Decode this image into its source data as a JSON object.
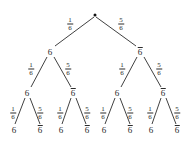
{
  "diagram": {
    "type": "probability-tree",
    "levels": 3,
    "background_color": "#ffffff",
    "line_color": "#2b2b2b",
    "text_color": "#2b2b2b",
    "branch_labels": {
      "left": "1/6",
      "right": "5/6"
    },
    "fraction": {
      "numerator_left": "1",
      "denominator_left": "6",
      "numerator_right": "5",
      "denominator_right": "6"
    },
    "node_labels": {
      "success": "6",
      "failure": "6"
    },
    "root": {
      "name": "root-node",
      "x": 95,
      "y": 15,
      "label": ""
    },
    "level1": [
      {
        "name": "node-6",
        "x": 50,
        "y": 52,
        "label": "6",
        "overbar": false
      },
      {
        "name": "node-not6",
        "x": 140,
        "y": 52,
        "label": "6",
        "overbar": true
      }
    ],
    "level2": [
      {
        "name": "node-6",
        "x": 27,
        "y": 93,
        "label": "6",
        "overbar": false
      },
      {
        "name": "node-not6",
        "x": 73,
        "y": 93,
        "label": "6",
        "overbar": true
      },
      {
        "name": "node-6",
        "x": 117,
        "y": 93,
        "label": "6",
        "overbar": false
      },
      {
        "name": "node-not6",
        "x": 163,
        "y": 93,
        "label": "6",
        "overbar": true
      }
    ],
    "level3": [
      {
        "name": "leaf-6",
        "x": 14,
        "y": 130,
        "label": "6",
        "overbar": false
      },
      {
        "name": "leaf-not6",
        "x": 40,
        "y": 130,
        "label": "6",
        "overbar": true
      },
      {
        "name": "leaf-6",
        "x": 61,
        "y": 130,
        "label": "6",
        "overbar": false
      },
      {
        "name": "leaf-not6",
        "x": 87,
        "y": 130,
        "label": "6",
        "overbar": true
      },
      {
        "name": "leaf-6",
        "x": 104,
        "y": 130,
        "label": "6",
        "overbar": false
      },
      {
        "name": "leaf-not6",
        "x": 130,
        "y": 130,
        "label": "6",
        "overbar": true
      },
      {
        "name": "leaf-6",
        "x": 151,
        "y": 130,
        "label": "6",
        "overbar": false
      },
      {
        "name": "leaf-not6",
        "x": 177,
        "y": 130,
        "label": "6",
        "overbar": true
      }
    ],
    "edge_labels": [
      {
        "name": "edge-label-root-left",
        "x": 70,
        "y": 24,
        "num": "1",
        "den": "6"
      },
      {
        "name": "edge-label-root-right",
        "x": 121,
        "y": 24,
        "num": "5",
        "den": "6"
      },
      {
        "name": "edge-label-l1a-left",
        "x": 31,
        "y": 69,
        "num": "1",
        "den": "6"
      },
      {
        "name": "edge-label-l1a-right",
        "x": 68,
        "y": 69,
        "num": "5",
        "den": "6"
      },
      {
        "name": "edge-label-l1b-left",
        "x": 122,
        "y": 69,
        "num": "1",
        "den": "6"
      },
      {
        "name": "edge-label-l1b-right",
        "x": 159,
        "y": 69,
        "num": "5",
        "den": "6"
      },
      {
        "name": "edge-label-l2a-left",
        "x": 13,
        "y": 113,
        "num": "1",
        "den": "6"
      },
      {
        "name": "edge-label-l2a-right",
        "x": 40,
        "y": 113,
        "num": "5",
        "den": "6"
      },
      {
        "name": "edge-label-l2b-left",
        "x": 60,
        "y": 113,
        "num": "1",
        "den": "6"
      },
      {
        "name": "edge-label-l2b-right",
        "x": 87,
        "y": 113,
        "num": "5",
        "den": "6"
      },
      {
        "name": "edge-label-l2c-left",
        "x": 103,
        "y": 113,
        "num": "1",
        "den": "6"
      },
      {
        "name": "edge-label-l2c-right",
        "x": 130,
        "y": 113,
        "num": "5",
        "den": "6"
      },
      {
        "name": "edge-label-l2d-left",
        "x": 150,
        "y": 113,
        "num": "1",
        "den": "6"
      },
      {
        "name": "edge-label-l2d-right",
        "x": 177,
        "y": 113,
        "num": "5",
        "den": "6"
      }
    ],
    "edges": [
      {
        "name": "edge-root-left",
        "x1": 94,
        "y1": 17,
        "x2": 55,
        "y2": 46
      },
      {
        "name": "edge-root-right",
        "x1": 96,
        "y1": 17,
        "x2": 136,
        "y2": 46
      },
      {
        "name": "edge-l1a-left",
        "x1": 47,
        "y1": 57,
        "x2": 31,
        "y2": 87
      },
      {
        "name": "edge-l1a-right",
        "x1": 54,
        "y1": 57,
        "x2": 71,
        "y2": 87
      },
      {
        "name": "edge-l1b-left",
        "x1": 137,
        "y1": 57,
        "x2": 121,
        "y2": 87
      },
      {
        "name": "edge-l1b-right",
        "x1": 144,
        "y1": 57,
        "x2": 161,
        "y2": 87
      },
      {
        "name": "edge-l2a-left",
        "x1": 25,
        "y1": 98,
        "x2": 15,
        "y2": 124
      },
      {
        "name": "edge-l2a-right",
        "x1": 30,
        "y1": 98,
        "x2": 40,
        "y2": 124
      },
      {
        "name": "edge-l2b-left",
        "x1": 71,
        "y1": 98,
        "x2": 62,
        "y2": 124
      },
      {
        "name": "edge-l2b-right",
        "x1": 76,
        "y1": 98,
        "x2": 86,
        "y2": 124
      },
      {
        "name": "edge-l2c-left",
        "x1": 115,
        "y1": 98,
        "x2": 105,
        "y2": 124
      },
      {
        "name": "edge-l2c-right",
        "x1": 120,
        "y1": 98,
        "x2": 130,
        "y2": 124
      },
      {
        "name": "edge-l2d-left",
        "x1": 161,
        "y1": 98,
        "x2": 152,
        "y2": 124
      },
      {
        "name": "edge-l2d-right",
        "x1": 166,
        "y1": 98,
        "x2": 176,
        "y2": 124
      }
    ]
  }
}
